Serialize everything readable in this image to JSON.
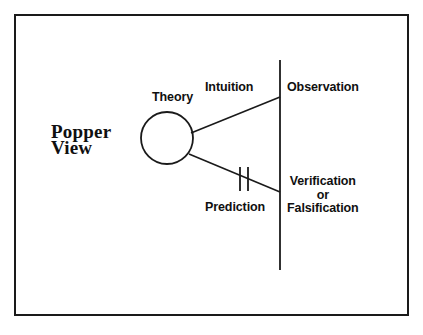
{
  "diagram": {
    "title_block": {
      "name": "popper-view-title",
      "lines": [
        "Popper",
        "View"
      ]
    },
    "nodes": {
      "theory": {
        "label": "Theory",
        "shape": "circle",
        "cx": 167,
        "cy": 138,
        "r": 26
      },
      "observation": {
        "label": "Observation"
      },
      "verification": {
        "lines": [
          "Verification",
          "or",
          "Falsification"
        ]
      }
    },
    "edges": [
      {
        "name": "intuition-edge",
        "label": "Intuition",
        "from": "theory",
        "to": "observation",
        "x1": 191,
        "y1": 133,
        "x2": 280,
        "y2": 97,
        "marked": false
      },
      {
        "name": "prediction-edge",
        "label": "Prediction",
        "from": "theory",
        "to": "verification",
        "x1": 189,
        "y1": 154,
        "x2": 280,
        "y2": 192,
        "marked": true,
        "mark_type": "double-slash"
      }
    ],
    "reality_line": {
      "name": "reality-boundary-line",
      "x": 280,
      "y1": 60,
      "y2": 270
    },
    "marks": {
      "name": "double-tick-mark",
      "tick1_x": 240,
      "tick2_x": 248,
      "y_top": 167,
      "y_bottom": 191
    },
    "frame": {
      "x": 14,
      "y": 14,
      "width": 395,
      "height": 302
    },
    "colors": {
      "ink": "#1a1a1a",
      "text": "#101010",
      "background": "#ffffff"
    }
  }
}
